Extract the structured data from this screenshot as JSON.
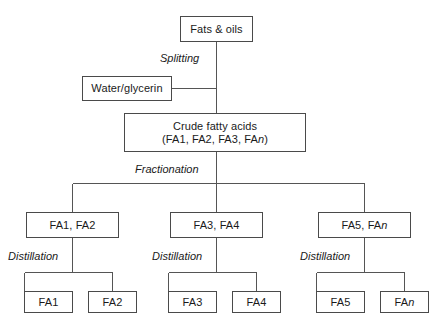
{
  "diagram": {
    "background": "#ffffff",
    "line_color": "#555555",
    "box_border_color": "#4a4a4a",
    "text_color": "#1a1a1a",
    "nodes": {
      "fats_oils": {
        "label": "Fats & oils"
      },
      "water_glycerin": {
        "label": "Water/glycerin"
      },
      "crude_fatty_acids": {
        "line1": "Crude fatty acids",
        "line2_prefix": "(FA1, FA2, FA3, FA",
        "line2_italic": "n",
        "line2_suffix": ")"
      },
      "branch_left": {
        "label": "FA1, FA2"
      },
      "branch_middle": {
        "label": "FA3, FA4"
      },
      "branch_right_prefix": "FA5, FA",
      "branch_right_italic": "n",
      "branch_right_suffix": "",
      "leaf_fa1": {
        "label": "FA1"
      },
      "leaf_fa2": {
        "label": "FA2"
      },
      "leaf_fa3": {
        "label": "FA3"
      },
      "leaf_fa4": {
        "label": "FA4"
      },
      "leaf_fa5": {
        "label": "FA5"
      },
      "leaf_fan_prefix": "FA",
      "leaf_fan_italic": "n"
    },
    "edge_labels": {
      "splitting": "Splitting",
      "fractionation": "Fractionation",
      "distillation_left": "Distillation",
      "distillation_middle": "Distillation",
      "distillation_right": "Distillation"
    }
  }
}
